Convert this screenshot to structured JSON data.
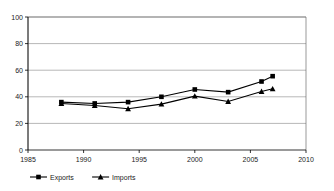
{
  "chart_data": {
    "type": "line",
    "title": "",
    "subtitle": "",
    "xlabel": "",
    "ylabel": "",
    "xlim": [
      1985,
      2010
    ],
    "ylim": [
      0,
      100
    ],
    "grid": true,
    "grid_axis": "y",
    "legend_position": "bottom-left",
    "x_ticks": [
      1985,
      1990,
      1995,
      2000,
      2005,
      2010
    ],
    "x_tick_labels": [
      "1985",
      "1990",
      "1995",
      "2000",
      "2005",
      "2010"
    ],
    "y_ticks": [
      0,
      20,
      40,
      60,
      80,
      100
    ],
    "y_tick_labels": [
      "0",
      "20",
      "40",
      "60",
      "80",
      "100"
    ],
    "x": [
      1988,
      1991,
      1994,
      1997,
      2000,
      2003,
      2006,
      2007
    ],
    "series": [
      {
        "name": "Exports",
        "marker": "square",
        "color": "#000000",
        "values": [
          36,
          35,
          36,
          40,
          45.5,
          43.5,
          51.5,
          55.5
        ]
      },
      {
        "name": "Imports",
        "marker": "triangle",
        "color": "#000000",
        "values": [
          35,
          33.5,
          31,
          34.5,
          40.5,
          36.5,
          44,
          46
        ]
      }
    ]
  },
  "legend": {
    "items": [
      {
        "label": "Exports",
        "marker": "square"
      },
      {
        "label": "Imports",
        "marker": "triangle"
      }
    ]
  },
  "colors": {
    "axis": "#000000",
    "grid": "#9a9a9a",
    "plot_border": "#6e6e6e",
    "series": "#000000",
    "background": "#ffffff"
  }
}
